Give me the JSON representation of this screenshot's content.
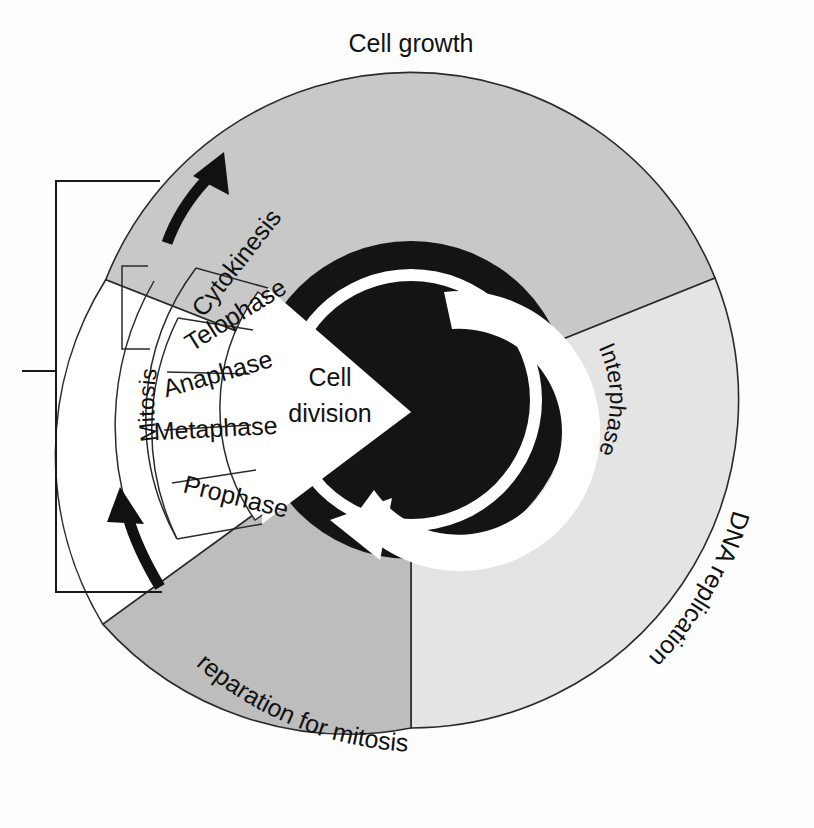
{
  "figure": {
    "type": "circular-cycle-diagram"
  },
  "outer_labels": {
    "cell_growth": "Cell growth",
    "dna_replication": "DNA replication",
    "preparation_for_mitosis": "Preparation for mitosis"
  },
  "center": {
    "cell_division_line1": "Cell",
    "cell_division_line2": "division"
  },
  "ring": {
    "interphase": "Interphase"
  },
  "bracket": {
    "mitosis": "Mitosis"
  },
  "mitosis_phases": [
    {
      "label": "Cytokinesis"
    },
    {
      "label": "Telophase"
    },
    {
      "label": "Anaphase"
    },
    {
      "label": "Metaphase"
    },
    {
      "label": "Prophase"
    }
  ],
  "colors": {
    "background": "#fdfdfd",
    "cell_growth_fill": "#c8c8c8",
    "dna_replication_fill": "#e4e4e4",
    "preparation_fill": "#bdbdbd",
    "inner_dark": "#141414",
    "white": "#ffffff",
    "outline": "#2b2b2b",
    "text": "#111111"
  },
  "geometry": {
    "center_x": 411,
    "center_y": 400,
    "outer_radius": 328,
    "inner_dark_outer_radius": 158,
    "inner_dark_inner_radius": 120,
    "white_band_outer_radius": 131,
    "white_band_inner_radius": 119
  },
  "arrows": {
    "top_arrow": "curved-arrow-counterclockwise",
    "bottom_arrow": "curved-arrow-counterclockwise",
    "center_arrow": "circular-arrow-white"
  }
}
